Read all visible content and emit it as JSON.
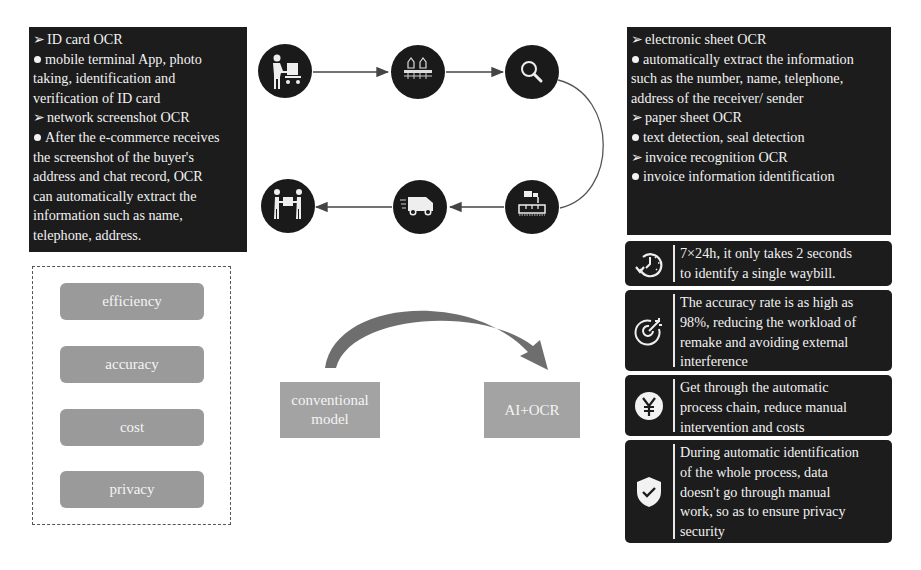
{
  "left_panel": {
    "lines": [
      {
        "type": "arrow",
        "text": "ID card OCR"
      },
      {
        "type": "dot",
        "text": "mobile terminal App, photo"
      },
      {
        "type": "plain",
        "text": "taking, identification and"
      },
      {
        "type": "plain",
        "text": "verification of ID card"
      },
      {
        "type": "arrow",
        "text": "network screenshot OCR"
      },
      {
        "type": "dot",
        "text": "After the e-commerce receives"
      },
      {
        "type": "plain",
        "text": "the screenshot of the buyer's"
      },
      {
        "type": "plain",
        "text": "address and chat record, OCR"
      },
      {
        "type": "plain",
        "text": "can automatically extract the"
      },
      {
        "type": "plain",
        "text": "information such as name,"
      },
      {
        "type": "plain",
        "text": "telephone, address."
      }
    ]
  },
  "right_panel": {
    "lines": [
      {
        "type": "arrow",
        "text": "electronic sheet OCR"
      },
      {
        "type": "dot",
        "text": "automatically extract the information"
      },
      {
        "type": "plain",
        "text": "such as the number, name, telephone,"
      },
      {
        "type": "plain",
        "text": "address of the receiver/ sender"
      },
      {
        "type": "arrow",
        "text": "paper sheet OCR"
      },
      {
        "type": "dot",
        "text": "text detection, seal detection"
      },
      {
        "type": "arrow",
        "text": "invoice recognition OCR"
      },
      {
        "type": "dot",
        "text": "invoice information  identification"
      }
    ]
  },
  "process_flow": {
    "steps": [
      {
        "icon": "worker-with-cart-icon",
        "row": "top"
      },
      {
        "icon": "sorting-machine-icon",
        "row": "top"
      },
      {
        "icon": "magnifier-icon",
        "row": "top"
      },
      {
        "icon": "robotic-sorting-icon",
        "row": "bottom"
      },
      {
        "icon": "delivery-truck-icon",
        "row": "bottom"
      },
      {
        "icon": "package-handover-icon",
        "row": "bottom"
      }
    ]
  },
  "features": [
    {
      "icon": "clock-24h-icon",
      "lines": [
        "7×24h, it only takes 2 seconds",
        "to identify a single waybill."
      ]
    },
    {
      "icon": "target-icon",
      "lines": [
        "The accuracy rate is as high as",
        "98%, reducing the workload of",
        "remake and avoiding external",
        "interference"
      ]
    },
    {
      "icon": "yuan-icon",
      "lines": [
        "Get through the automatic",
        "process chain, reduce manual",
        "intervention and costs"
      ]
    },
    {
      "icon": "shield-check-icon",
      "lines": [
        "During automatic identification",
        "of the whole process, data",
        "doesn't go through manual",
        "work, so as to ensure privacy",
        "security"
      ]
    }
  ],
  "advantages": [
    "efficiency",
    "accuracy",
    "cost",
    "privacy"
  ],
  "transition": {
    "from_label_lines": [
      "conventional",
      "model"
    ],
    "to_label": "AI+OCR"
  },
  "colors": {
    "dark_panel": "#1c1c1c",
    "pill": "#9a9a9a",
    "model_box": "#a3a3a3",
    "curved_arrow": "#666666",
    "connector": "#444444"
  }
}
